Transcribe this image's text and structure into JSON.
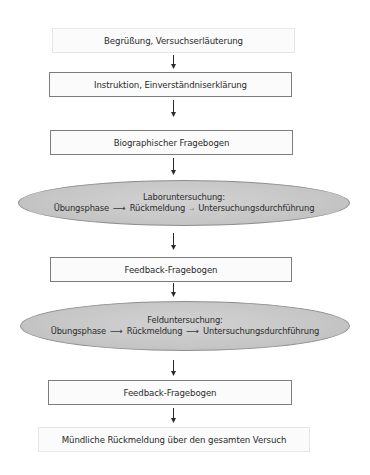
{
  "diagram": {
    "type": "flowchart",
    "direction": "top-to-bottom",
    "colors": {
      "box_border": "#7d7d7d",
      "box_border_faint": "#e6e6e6",
      "ellipse_fill": "#c6c6c6",
      "ellipse_border": "#8c8c8c",
      "text": "#2a2a2a",
      "arrow": "#2a2a2a"
    },
    "steps": [
      {
        "id": "step-1",
        "shape": "rectangle",
        "label": "Begrüßung, Versuchserläuterung"
      },
      {
        "id": "step-2",
        "shape": "rectangle",
        "label": "Instruktion, Einverständniserklärung"
      },
      {
        "id": "step-3",
        "shape": "rectangle",
        "label": "Biographischer Fragebogen"
      },
      {
        "id": "step-4",
        "shape": "ellipse",
        "title": "Laboruntersuchung:",
        "phases": [
          "Übungsphase",
          "Rückmeldung",
          "Untersuchungsdurchführung"
        ],
        "arrow_glyph": "⟶"
      },
      {
        "id": "step-5",
        "shape": "rectangle",
        "label": "Feedback-Fragebogen"
      },
      {
        "id": "step-6",
        "shape": "ellipse",
        "title": "Felduntersuchung:",
        "phases": [
          "Übungsphase",
          "Rückmeldung",
          "Untersuchungsdurchführung"
        ],
        "arrow_glyph": "⟶"
      },
      {
        "id": "step-7",
        "shape": "rectangle",
        "label": "Feedback-Fragebogen"
      },
      {
        "id": "step-8",
        "shape": "rectangle",
        "label": "Mündliche Rückmeldung über den gesamten Versuch"
      }
    ],
    "connectors": [
      {
        "from": "step-1",
        "to": "step-2",
        "icon": "arrow-down-icon"
      },
      {
        "from": "step-2",
        "to": "step-3",
        "icon": "arrow-down-icon"
      },
      {
        "from": "step-3",
        "to": "step-4",
        "icon": "arrow-down-icon"
      },
      {
        "from": "step-4",
        "to": "step-5",
        "icon": "arrow-down-icon"
      },
      {
        "from": "step-5",
        "to": "step-6",
        "icon": "arrow-down-icon"
      },
      {
        "from": "step-6",
        "to": "step-7",
        "icon": "arrow-down-icon"
      },
      {
        "from": "step-7",
        "to": "step-8",
        "icon": "arrow-down-icon"
      }
    ]
  }
}
